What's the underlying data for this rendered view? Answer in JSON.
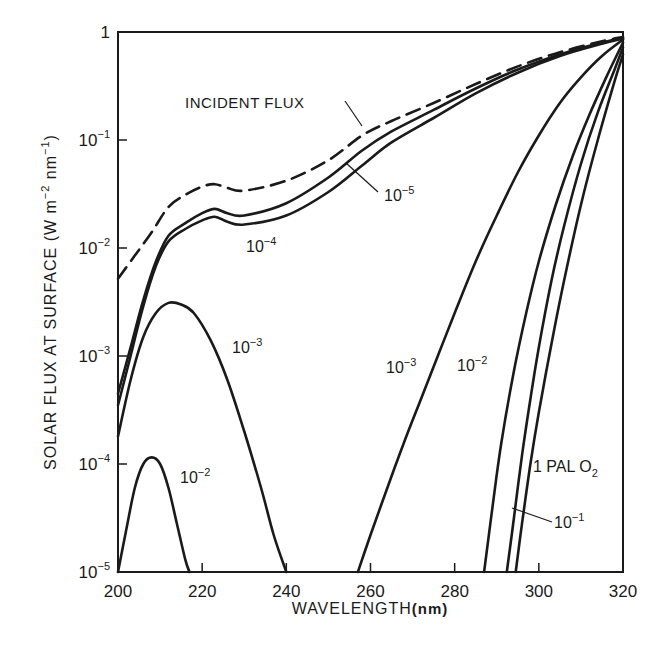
{
  "chart_data": {
    "type": "line",
    "title": "",
    "xlabel": "WAVELENGTH (nm)",
    "ylabel": "SOLAR FLUX AT SURFACE (W m^-2 nm^-1)",
    "xlim": [
      200,
      320
    ],
    "ylim": [
      1e-05,
      1
    ],
    "yscale": "log",
    "grid": false,
    "x_ticks": [
      200,
      220,
      240,
      260,
      280,
      300,
      320
    ],
    "y_ticks": [
      {
        "value": 1,
        "base": "1",
        "exp": ""
      },
      {
        "value": 0.1,
        "base": "10",
        "exp": "−1"
      },
      {
        "value": 0.01,
        "base": "10",
        "exp": "−2"
      },
      {
        "value": 0.001,
        "base": "10",
        "exp": "−3"
      },
      {
        "value": 0.0001,
        "base": "10",
        "exp": "−4"
      },
      {
        "value": 1e-05,
        "base": "10",
        "exp": "−5"
      }
    ],
    "series": [
      {
        "name": "Incident flux",
        "style": "dashed",
        "x": [
          200,
          204,
          208,
          212,
          216,
          220,
          223,
          226,
          230,
          240,
          250,
          258,
          265,
          275,
          285,
          295,
          305,
          315,
          320
        ],
        "y": [
          0.0052,
          0.0085,
          0.014,
          0.024,
          0.031,
          0.037,
          0.039,
          0.036,
          0.034,
          0.042,
          0.065,
          0.11,
          0.15,
          0.22,
          0.33,
          0.48,
          0.65,
          0.82,
          0.9
        ]
      },
      {
        "name": "10^-5 PAL O2",
        "style": "solid",
        "x": [
          200,
          203,
          206,
          209,
          212,
          216,
          220,
          223,
          226,
          230,
          240,
          250,
          258,
          265,
          275,
          285,
          295,
          305,
          315,
          320
        ],
        "y": [
          0.00045,
          0.0012,
          0.0033,
          0.0075,
          0.013,
          0.017,
          0.021,
          0.023,
          0.021,
          0.02,
          0.026,
          0.045,
          0.08,
          0.12,
          0.19,
          0.3,
          0.45,
          0.62,
          0.8,
          0.88
        ]
      },
      {
        "name": "10^-4 PAL O2",
        "style": "solid",
        "x": [
          200,
          203,
          206,
          209,
          212,
          216,
          220,
          223,
          226,
          230,
          240,
          250,
          258,
          265,
          275,
          285,
          295,
          305,
          315,
          320
        ],
        "y": [
          0.00035,
          0.001,
          0.0029,
          0.0068,
          0.0115,
          0.015,
          0.018,
          0.0195,
          0.0175,
          0.0165,
          0.02,
          0.033,
          0.058,
          0.095,
          0.16,
          0.27,
          0.42,
          0.6,
          0.78,
          0.87
        ]
      },
      {
        "name": "10^-3 PAL O2 (short-wave)",
        "style": "solid",
        "x": [
          200,
          203,
          206,
          209,
          212,
          215,
          218,
          222,
          226,
          230,
          234,
          237,
          240
        ],
        "y": [
          0.00018,
          0.0006,
          0.0015,
          0.0025,
          0.0031,
          0.003,
          0.0025,
          0.0014,
          0.0006,
          0.0002,
          6e-05,
          2.2e-05,
          1e-05
        ]
      },
      {
        "name": "10^-2 PAL O2 (short-wave)",
        "style": "solid",
        "x": [
          200,
          202,
          204,
          206,
          208,
          210,
          212,
          214,
          216,
          217
        ],
        "y": [
          1e-05,
          2.5e-05,
          6e-05,
          0.0001,
          0.000115,
          0.0001,
          6e-05,
          2.8e-05,
          1.3e-05,
          1e-05
        ]
      },
      {
        "name": "10^-3 PAL O2 (long-wave)",
        "style": "solid",
        "x": [
          257,
          260,
          264,
          268,
          272,
          276,
          280,
          285,
          290,
          295,
          300,
          305,
          310,
          315,
          320
        ],
        "y": [
          1e-05,
          2.2e-05,
          6e-05,
          0.00016,
          0.0004,
          0.001,
          0.0025,
          0.0075,
          0.02,
          0.05,
          0.11,
          0.22,
          0.38,
          0.6,
          0.85
        ]
      },
      {
        "name": "10^-2 PAL O2 (long-wave)",
        "style": "solid",
        "x": [
          287,
          289,
          291,
          294,
          297,
          300,
          304,
          308,
          312,
          316,
          320
        ],
        "y": [
          1e-05,
          4e-05,
          0.00015,
          0.0007,
          0.0025,
          0.0075,
          0.025,
          0.07,
          0.17,
          0.38,
          0.8
        ]
      },
      {
        "name": "10^-1 PAL O2",
        "style": "solid",
        "x": [
          292.4,
          294,
          296,
          298,
          300,
          303,
          306,
          310,
          314,
          318,
          320
        ],
        "y": [
          1e-05,
          3e-05,
          0.00012,
          0.0004,
          0.0012,
          0.005,
          0.016,
          0.06,
          0.18,
          0.45,
          0.72
        ]
      },
      {
        "name": "1 PAL O2",
        "style": "solid",
        "x": [
          294.5,
          296,
          298,
          300,
          303,
          306,
          310,
          314,
          318,
          320
        ],
        "y": [
          1e-05,
          2.8e-05,
          0.0001,
          0.0003,
          0.0013,
          0.005,
          0.025,
          0.1,
          0.35,
          0.62
        ]
      }
    ],
    "annotations": [
      {
        "text": "INCIDENT FLUX",
        "x": 229,
        "y": 0.15
      },
      {
        "text": "10^-5",
        "x": 264,
        "y": 0.055
      },
      {
        "text": "10^-4",
        "x": 227,
        "y": 0.011
      },
      {
        "text": "10^-3",
        "x": 223,
        "y": 0.0016
      },
      {
        "text": "10^-2",
        "x": 213,
        "y": 9e-05
      },
      {
        "text": "10^-3",
        "x": 263,
        "y": 0.0012
      },
      {
        "text": "10^-2",
        "x": 279,
        "y": 0.0012
      },
      {
        "text": "1 PAL O2",
        "x": 300,
        "y": 0.00012
      },
      {
        "text": "10^-1",
        "x": 305,
        "y": 2.7e-05
      }
    ]
  },
  "labels": {
    "xlabel_main": "WAVELENGTH",
    "xlabel_unit": "(nm)",
    "ylabel_prefix": "SOLAR FLUX AT SURFACE (W m",
    "ylabel_exp1": "−2",
    "ylabel_mid": " nm",
    "ylabel_exp2": "−1",
    "ylabel_suffix": ")",
    "incident_flux": "INCIDENT FLUX",
    "ten": "10",
    "exp_m5": "−5",
    "exp_m4": "−4",
    "exp_m3": "−3",
    "exp_m2": "−2",
    "exp_m1": "−1",
    "one_pal": "1 PAL O",
    "o2_sub": "2"
  }
}
